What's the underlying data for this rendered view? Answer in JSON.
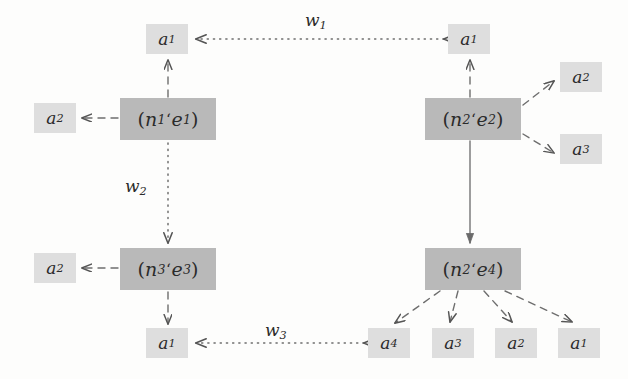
{
  "diagram": {
    "colors": {
      "node_fill": "#b9b9b9",
      "action_fill": "#dedede",
      "ink": "#2b2b2b",
      "background": "#fdfdfc"
    },
    "nodes": [
      {
        "id": "n1e1",
        "label_n": "n",
        "label_n_sub": "1",
        "label_e": "e",
        "label_e_sub": "1",
        "sep": "ʻ",
        "x": 120,
        "y": 98,
        "w": 96,
        "h": 42
      },
      {
        "id": "n2e2",
        "label_n": "n",
        "label_n_sub": "2",
        "label_e": "e",
        "label_e_sub": "2",
        "sep": "ʻ",
        "x": 425,
        "y": 98,
        "w": 96,
        "h": 42
      },
      {
        "id": "n3e3",
        "label_n": "n",
        "label_n_sub": "3",
        "label_e": "e",
        "label_e_sub": "3",
        "sep": "ʻ",
        "x": 120,
        "y": 248,
        "w": 96,
        "h": 42
      },
      {
        "id": "n2e4",
        "label_n": "n",
        "label_n_sub": "2",
        "label_e": "e",
        "label_e_sub": "4",
        "sep": "ʻ",
        "x": 425,
        "y": 248,
        "w": 96,
        "h": 42
      }
    ],
    "actions": [
      {
        "id": "a1-top-left",
        "label": "a",
        "sub": "1",
        "x": 146,
        "y": 24,
        "w": 42,
        "h": 30
      },
      {
        "id": "a1-top-right",
        "label": "a",
        "sub": "1",
        "x": 448,
        "y": 24,
        "w": 42,
        "h": 30
      },
      {
        "id": "a2-left-upper",
        "label": "a",
        "sub": "2",
        "x": 34,
        "y": 103,
        "w": 42,
        "h": 30
      },
      {
        "id": "a2-right-upper",
        "label": "a",
        "sub": "2",
        "x": 560,
        "y": 62,
        "w": 42,
        "h": 30
      },
      {
        "id": "a3-right-upper",
        "label": "a",
        "sub": "3",
        "x": 560,
        "y": 134,
        "w": 42,
        "h": 30
      },
      {
        "id": "a2-left-lower",
        "label": "a",
        "sub": "2",
        "x": 34,
        "y": 253,
        "w": 42,
        "h": 30
      },
      {
        "id": "a1-bottom-left",
        "label": "a",
        "sub": "1",
        "x": 146,
        "y": 328,
        "w": 42,
        "h": 30
      },
      {
        "id": "a4-bottom",
        "label": "a",
        "sub": "4",
        "x": 368,
        "y": 328,
        "w": 42,
        "h": 30
      },
      {
        "id": "a3-bottom",
        "label": "a",
        "sub": "3",
        "x": 432,
        "y": 328,
        "w": 42,
        "h": 30
      },
      {
        "id": "a2-bottom",
        "label": "a",
        "sub": "2",
        "x": 495,
        "y": 328,
        "w": 42,
        "h": 30
      },
      {
        "id": "a1-bottom",
        "label": "a",
        "sub": "1",
        "x": 558,
        "y": 328,
        "w": 42,
        "h": 30
      }
    ],
    "weights": [
      {
        "id": "w1",
        "label": "w",
        "sub": "1",
        "x": 305,
        "y": 10
      },
      {
        "id": "w2",
        "label": "w",
        "sub": "2",
        "x": 125,
        "y": 176
      },
      {
        "id": "w3",
        "label": "w",
        "sub": "3",
        "x": 265,
        "y": 320
      }
    ],
    "edges": [
      {
        "id": "edge-n1e1-to-a1-top",
        "style": "dashed",
        "from": "n1e1",
        "to": "a1-top-left"
      },
      {
        "id": "edge-n1e1-to-a2-left",
        "style": "dashed",
        "from": "n1e1",
        "to": "a2-left-upper"
      },
      {
        "id": "edge-n2e2-to-a1-top",
        "style": "dashed",
        "from": "n2e2",
        "to": "a1-top-right"
      },
      {
        "id": "edge-n2e2-to-a2-right",
        "style": "dashed",
        "from": "n2e2",
        "to": "a2-right-upper"
      },
      {
        "id": "edge-n2e2-to-a3-right",
        "style": "dashed",
        "from": "n2e2",
        "to": "a3-right-upper"
      },
      {
        "id": "edge-n3e3-to-a2-left",
        "style": "dashed",
        "from": "n3e3",
        "to": "a2-left-lower"
      },
      {
        "id": "edge-n3e3-to-a1-bottom",
        "style": "dashed",
        "from": "n3e3",
        "to": "a1-bottom-left"
      },
      {
        "id": "edge-n2e4-to-a4",
        "style": "dashed",
        "from": "n2e4",
        "to": "a4-bottom"
      },
      {
        "id": "edge-n2e4-to-a3",
        "style": "dashed",
        "from": "n2e4",
        "to": "a3-bottom"
      },
      {
        "id": "edge-n2e4-to-a2",
        "style": "dashed",
        "from": "n2e4",
        "to": "a2-bottom"
      },
      {
        "id": "edge-n2e4-to-a1",
        "style": "dashed",
        "from": "n2e4",
        "to": "a1-bottom"
      },
      {
        "id": "edge-n2e2-to-n2e4",
        "style": "solid",
        "from": "n2e2",
        "to": "n2e4"
      },
      {
        "id": "edge-w1",
        "style": "dotted",
        "from": "a1-top-right",
        "to": "a1-top-left",
        "weight": "w1"
      },
      {
        "id": "edge-w2",
        "style": "dotted",
        "from": "n1e1",
        "to": "n3e3",
        "weight": "w2"
      },
      {
        "id": "edge-w3",
        "style": "dotted",
        "from": "a4-bottom",
        "to": "a1-bottom-left",
        "weight": "w3"
      }
    ]
  }
}
